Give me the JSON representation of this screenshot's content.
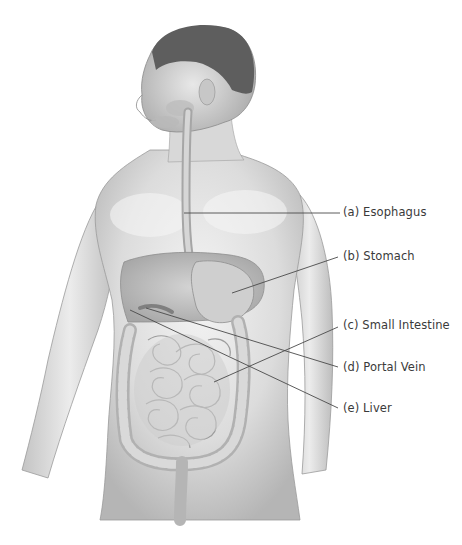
{
  "diagram": {
    "colors": {
      "background": "#ffffff",
      "skin_light": "#e9e9e9",
      "skin_mid": "#cfcfcf",
      "skin_dark": "#a9a9a9",
      "hair": "#5a5a5a",
      "organ": "#bdbdbd",
      "leader_line": "#4a4a4a",
      "label_text": "#3a3a3a"
    },
    "labels": [
      {
        "id": "a",
        "text": "(a) Esophagus",
        "x": 343,
        "y": 207,
        "line": {
          "x1": 184,
          "y1": 213,
          "x2": 340,
          "y2": 213
        }
      },
      {
        "id": "b",
        "text": "(b) Stomach",
        "x": 343,
        "y": 251,
        "line": {
          "x1": 232,
          "y1": 293,
          "x2": 338,
          "y2": 257
        }
      },
      {
        "id": "c",
        "text": "(c) Small Intestine",
        "x": 343,
        "y": 320,
        "line": {
          "x1": 214,
          "y1": 382,
          "x2": 338,
          "y2": 327
        }
      },
      {
        "id": "d",
        "text": "(d) Portal Vein",
        "x": 343,
        "y": 362,
        "line": {
          "x1": 146,
          "y1": 308,
          "x2": 338,
          "y2": 367
        }
      },
      {
        "id": "e",
        "text": "(e) Liver",
        "x": 343,
        "y": 403,
        "line": {
          "x1": 130,
          "y1": 310,
          "x2": 338,
          "y2": 408
        }
      }
    ],
    "caption": "Figure caption (partially cut off, illegible)"
  }
}
